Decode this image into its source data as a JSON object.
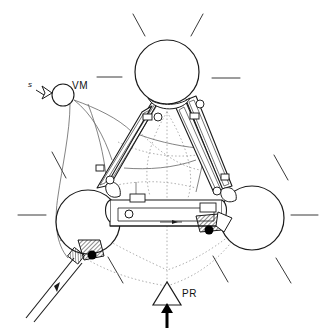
{
  "figure": {
    "type": "technical-line-drawing",
    "background_color": "#ffffff",
    "line_color": "#1a1a1a",
    "construction_color": "#8a8a8a",
    "fill_color": "#ffffff",
    "accent_color": "#000000"
  },
  "labels": {
    "vm": "VM",
    "pr": "PR",
    "s_dot": "s"
  },
  "annotations": {
    "vm_note": "moving vertex marker with hollow pointer arrow",
    "pr_note": "triangular support with upward applied force arrow",
    "s_dot_note": "velocity symbol s-dot beside hollow arrow"
  },
  "components": {
    "spheres": [
      {
        "name": "top-sphere",
        "cx": 167,
        "cy": 72,
        "r": 32
      },
      {
        "name": "left-sphere",
        "cx": 88,
        "cy": 222,
        "r": 32
      },
      {
        "name": "right-sphere",
        "cx": 252,
        "cy": 218,
        "r": 32
      }
    ],
    "vm_circle": {
      "cx": 63,
      "cy": 95,
      "r": 11
    },
    "joint_pivots": [
      {
        "cx": 158,
        "cy": 117
      },
      {
        "cx": 200,
        "cy": 104
      },
      {
        "cx": 108,
        "cy": 179
      },
      {
        "cx": 216,
        "cy": 190
      },
      {
        "cx": 129,
        "cy": 214
      }
    ],
    "clamps": [
      {
        "name": "left-lower-clamp",
        "x": 82,
        "y": 247
      },
      {
        "name": "right-center-clamp",
        "x": 205,
        "y": 215
      }
    ],
    "bearing_dots": [
      {
        "cx": 91,
        "cy": 254
      },
      {
        "cx": 209,
        "cy": 229
      }
    ],
    "radiating_dashes_count": 10
  },
  "interaction": {
    "canvas_label": "diagram-canvas"
  }
}
